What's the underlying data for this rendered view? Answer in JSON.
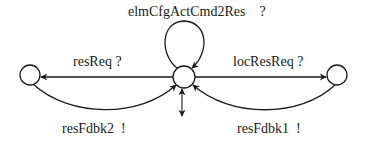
{
  "diagram": {
    "type": "state-transition",
    "nodes": [
      {
        "id": "left",
        "cx": 30,
        "cy": 74,
        "r": 10
      },
      {
        "id": "center",
        "cx": 184,
        "cy": 77,
        "r": 11
      },
      {
        "id": "right",
        "cx": 337,
        "cy": 75,
        "r": 10
      }
    ],
    "labels": {
      "self_loop": "elmCfgActCmd2Res    ?",
      "res_req": "resReq ?",
      "loc_res_req": "locResReq ?",
      "res_fdbk2": "resFdbk2  !",
      "res_fdbk1": "resFdbk1  !"
    },
    "edges": [
      {
        "from": "center",
        "to": "center",
        "label": "elmCfgActCmd2Res ?"
      },
      {
        "from": "center",
        "to": "left",
        "label": "resReq ?"
      },
      {
        "from": "left",
        "to": "center",
        "label": "resFdbk2 !"
      },
      {
        "from": "center",
        "to": "right",
        "label": "locResReq ?"
      },
      {
        "from": "right",
        "to": "center",
        "label": "resFdbk1 !"
      }
    ],
    "stroke_color": "#1a1a1a"
  }
}
